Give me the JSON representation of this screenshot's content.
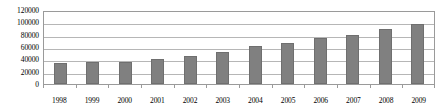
{
  "chart_data": {
    "type": "bar",
    "title": "",
    "subtitle": "",
    "xlabel": "",
    "ylabel": "",
    "categories": [
      "1998",
      "1999",
      "2000",
      "2001",
      "2002",
      "2003",
      "2004",
      "2005",
      "2006",
      "2007",
      "2008",
      "2009"
    ],
    "values": [
      34000,
      36000,
      36000,
      40000,
      45000,
      52000,
      61000,
      67000,
      74000,
      80000,
      89000,
      98000
    ],
    "series": [
      {
        "name": "",
        "values": [
          34000,
          36000,
          36000,
          40000,
          45000,
          52000,
          61000,
          67000,
          74000,
          80000,
          89000,
          98000
        ]
      }
    ],
    "ylim": [
      0,
      120000
    ],
    "ytick_values": [
      0,
      20000,
      40000,
      60000,
      80000,
      100000,
      120000
    ],
    "ytick_labels": [
      "0",
      "20000",
      "40000",
      "60000",
      "80000",
      "100000",
      "120000"
    ],
    "grid": true,
    "legend": false,
    "legend_position": "none",
    "annotations": [],
    "colors": {
      "bar_fill": "#808080",
      "bar_border": "#6f6f6f",
      "gridline": "#b6b6b6",
      "frame": "#9a9a9a",
      "background": "#ffffff",
      "text": "#000000"
    }
  }
}
